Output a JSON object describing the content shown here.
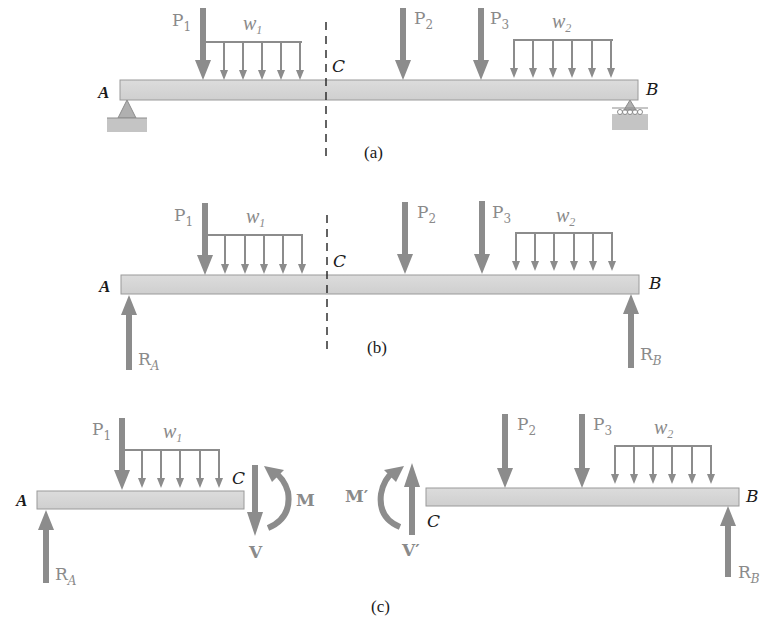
{
  "figure": {
    "panels": [
      {
        "id": "a",
        "caption": "(a)",
        "description": "Simply supported beam AB with pin at A and roller at B, cut section C shown dashed",
        "labels": {
          "left_end": "A",
          "right_end": "B",
          "section": "C"
        },
        "loads": [
          {
            "name": "P",
            "sub": "1",
            "type": "point"
          },
          {
            "name": "w",
            "sub": "1",
            "type": "distributed"
          },
          {
            "name": "P",
            "sub": "2",
            "type": "point"
          },
          {
            "name": "P",
            "sub": "3",
            "type": "point"
          },
          {
            "name": "w",
            "sub": "2",
            "type": "distributed"
          }
        ],
        "supports": [
          "pin-A",
          "roller-B"
        ]
      },
      {
        "id": "b",
        "caption": "(b)",
        "description": "Free body diagram of entire beam with reactions",
        "labels": {
          "left_end": "A",
          "right_end": "B",
          "section": "C"
        },
        "loads": [
          {
            "name": "P",
            "sub": "1"
          },
          {
            "name": "w",
            "sub": "1"
          },
          {
            "name": "P",
            "sub": "2"
          },
          {
            "name": "P",
            "sub": "3"
          },
          {
            "name": "w",
            "sub": "2"
          }
        ],
        "reactions": [
          {
            "name": "R",
            "sub": "A"
          },
          {
            "name": "R",
            "sub": "B"
          }
        ]
      },
      {
        "id": "c",
        "caption": "(c)",
        "description": "Free body diagrams of segments AC and CB with internal shear and moment",
        "left_segment": {
          "labels": {
            "left_end": "A",
            "right_end": "C"
          },
          "loads": [
            {
              "name": "P",
              "sub": "1"
            },
            {
              "name": "w",
              "sub": "1"
            }
          ],
          "reactions": [
            {
              "name": "R",
              "sub": "A"
            }
          ],
          "internal": {
            "shear": "V",
            "moment": "M"
          }
        },
        "right_segment": {
          "labels": {
            "left_end": "C",
            "right_end": "B"
          },
          "loads": [
            {
              "name": "P",
              "sub": "2"
            },
            {
              "name": "P",
              "sub": "3"
            },
            {
              "name": "w",
              "sub": "2"
            }
          ],
          "reactions": [
            {
              "name": "R",
              "sub": "B"
            }
          ],
          "internal": {
            "shear": "V′",
            "moment": "M′"
          }
        }
      }
    ],
    "text": {
      "A": "A",
      "B": "B",
      "C": "C",
      "P": "P",
      "R": "R",
      "w": "w",
      "s1": "1",
      "s2": "2",
      "s3": "3",
      "sA": "A",
      "sB": "B",
      "V": "V",
      "M": "M",
      "Vp": "V′",
      "Mp": "M′",
      "cap_a": "(a)",
      "cap_b": "(b)",
      "cap_c": "(c)"
    },
    "colors": {
      "load_gray": "#8c8c8c",
      "beam_fill": "#d6d6d6",
      "beam_stroke": "#9a9a9a",
      "text_dark": "#1a1a1a",
      "text_gray": "#8a8a8a"
    }
  }
}
